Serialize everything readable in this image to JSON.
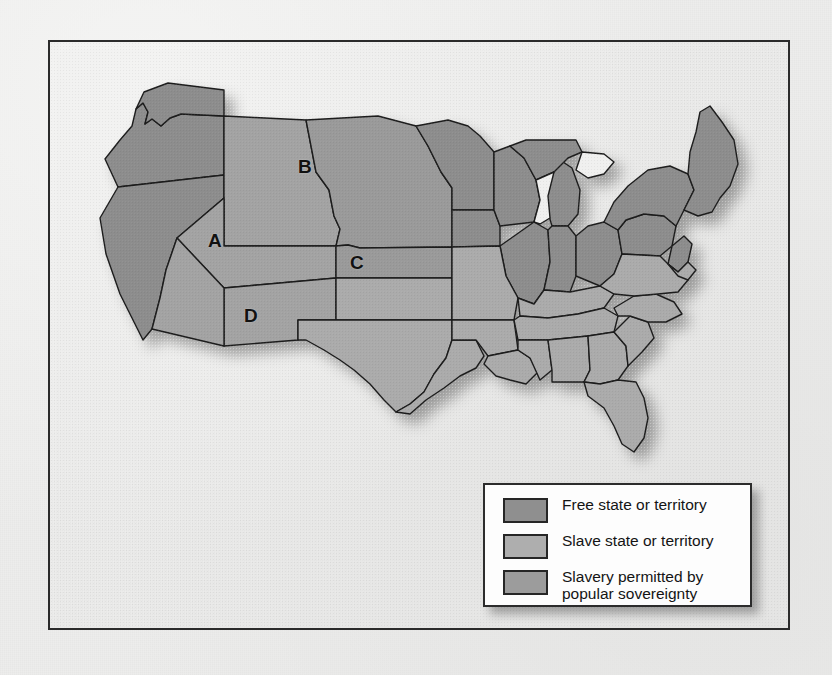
{
  "figure": {
    "kind": "historical-thematic-map",
    "frame_border_color": "#2b2b2b",
    "page_background": "#ededec"
  },
  "map": {
    "name": "united-states-map",
    "ocean_color": "#f2f2f1",
    "border_color": "#1d1d1d",
    "categories": {
      "free": {
        "key": "free",
        "color": "#8f8f8f",
        "label": "Free state or territory"
      },
      "slave": {
        "key": "slave",
        "color": "#a9a9a9",
        "label": "Slave state or territory"
      },
      "popular": {
        "key": "popular",
        "color": "#9c9c9c",
        "label": "Slavery permitted by popular sovereignty"
      },
      "lake": {
        "key": "lake",
        "color": "#f0f0ef",
        "label": "Great Lakes"
      }
    },
    "region_labels": [
      {
        "id": "A",
        "letter": "A",
        "x": 160,
        "y": 190,
        "category": "free",
        "note": "western territory"
      },
      {
        "id": "B",
        "letter": "B",
        "x": 250,
        "y": 116,
        "category": "popular",
        "note": "northern plains territory"
      },
      {
        "id": "C",
        "letter": "C",
        "x": 302,
        "y": 212,
        "category": "popular",
        "note": "central plains territory"
      },
      {
        "id": "D",
        "letter": "D",
        "x": 196,
        "y": 265,
        "category": "free",
        "note": "southwestern territory"
      }
    ]
  },
  "legend": {
    "name": "map-legend",
    "background": "#fdfdfd",
    "border_color": "#2c2c2c",
    "items": [
      {
        "swatch_color": "#8f8f8f",
        "label": "Free state or territory"
      },
      {
        "swatch_color": "#aeaeae",
        "label": "Slave state or territory"
      },
      {
        "swatch_color": "#9c9c9c",
        "label": "Slavery permitted by\npopular sovereignty"
      }
    ]
  }
}
